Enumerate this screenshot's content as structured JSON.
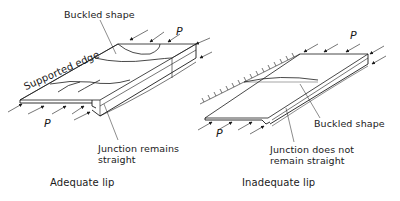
{
  "diagram": {
    "left_panel": {
      "caption": "Adequate lip",
      "labels": {
        "buckled_shape": "Buckled shape",
        "supported_edge": "Supported edge",
        "load_top": "P",
        "load_bottom": "P",
        "junction_line1": "Junction remains",
        "junction_line2": "straight"
      }
    },
    "right_panel": {
      "caption": "Inadequate lip",
      "labels": {
        "load_top": "P",
        "load_bottom": "P",
        "buckled_shape": "Buckled shape",
        "junction_line1": "Junction does not",
        "junction_line2": "remain straight"
      }
    },
    "colors": {
      "stroke": "#1a1a1a",
      "background": "#ffffff"
    }
  }
}
